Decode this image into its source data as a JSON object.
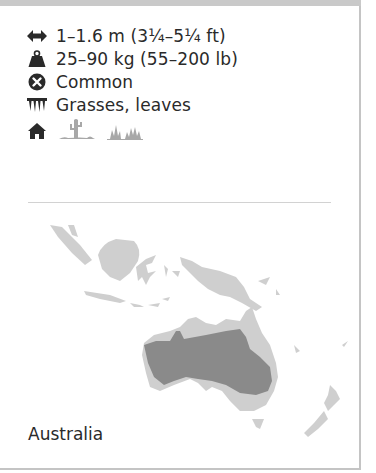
{
  "card": {
    "facts": [
      {
        "icon": "length-arrows-icon",
        "text": "1–1.6 m (3¼–5¼ ft)"
      },
      {
        "icon": "weight-icon",
        "text": "25–90 kg (55–200 lb)"
      },
      {
        "icon": "status-common-icon",
        "text": "Common"
      },
      {
        "icon": "diet-teeth-icon",
        "text": "Grasses, leaves"
      }
    ],
    "habitat": {
      "icons": [
        "home-icon",
        "desert-cactus-icon",
        "grassland-icon"
      ]
    },
    "map": {
      "region_label": "Australia",
      "colors": {
        "range": "#8a8a8a",
        "land": "#cfcfcf",
        "background": "#ffffff"
      }
    },
    "colors": {
      "top_bar": "#c9c9c9",
      "border": "#c4c4c4",
      "text": "#2a2a2a",
      "icon_dark": "#2a2a2a",
      "icon_light": "#a8a8a8"
    }
  }
}
